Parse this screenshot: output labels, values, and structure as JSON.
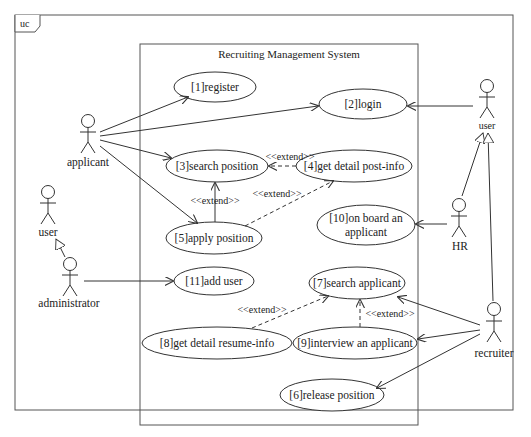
{
  "frame": {
    "tag": "uc"
  },
  "system": {
    "title": "Recruiting Management System"
  },
  "use_cases": {
    "register": {
      "label": "[1]register"
    },
    "login": {
      "label": "[2]login"
    },
    "search_position": {
      "label": "[3]search position"
    },
    "get_detail_post_info": {
      "label": "[4]get detail post-info"
    },
    "apply_position": {
      "label": "[5]apply position"
    },
    "release_position": {
      "label": "[6]release position"
    },
    "search_applicant": {
      "label": "[7]search applicant"
    },
    "get_detail_resume_info": {
      "label": "[8]get detail resume-info"
    },
    "interview_applicant": {
      "label": "[9]interview an applicant"
    },
    "on_board_applicant": {
      "line1": "[10]on board an",
      "line2": "applicant"
    },
    "add_user": {
      "label": "[11]add user"
    }
  },
  "actors": {
    "applicant": {
      "label": "applicant"
    },
    "user_left": {
      "label": "user"
    },
    "administrator": {
      "label": "administrator"
    },
    "user_right": {
      "label": "user"
    },
    "hr": {
      "label": "HR"
    },
    "recruiter": {
      "label": "recruiter"
    }
  },
  "relations": {
    "extend_4_to_3": "<<extend>>",
    "extend_5_to_3": "<<extend>>",
    "extend_5_to_4": "<<extend>>",
    "extend_8_to_7": "<<extend>>",
    "extend_9_to_7": "<<extend>>"
  },
  "colors": {
    "line": "#333333",
    "background": "#ffffff"
  }
}
